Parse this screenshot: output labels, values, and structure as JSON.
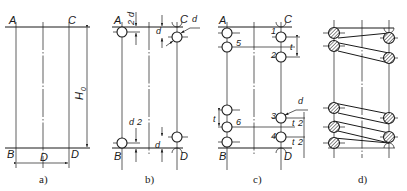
{
  "figure": {
    "panels": [
      {
        "id": "a",
        "caption": "a)",
        "points": {
          "A": "A",
          "B": "B",
          "C": "C",
          "D": "D"
        },
        "dimensions": {
          "height": "H",
          "height_sub": "0",
          "diameter": "D"
        }
      },
      {
        "id": "b",
        "caption": "b)",
        "points": {
          "A": "A",
          "B": "B",
          "C": "C",
          "D": "D"
        },
        "dimensions": {
          "half_d_num": "d",
          "half_d_den": "2",
          "d": "d",
          "wire": "d"
        }
      },
      {
        "id": "c",
        "caption": "c)",
        "points": {
          "A": "A",
          "B": "B",
          "C": "C",
          "D": "D"
        },
        "circle_numbers": [
          "1",
          "2",
          "3",
          "4",
          "5",
          "6"
        ],
        "dimensions": {
          "pitch": "t",
          "half_t_num": "t",
          "half_t_den": "2",
          "wire": "d"
        }
      },
      {
        "id": "d",
        "caption": "d)"
      }
    ]
  }
}
